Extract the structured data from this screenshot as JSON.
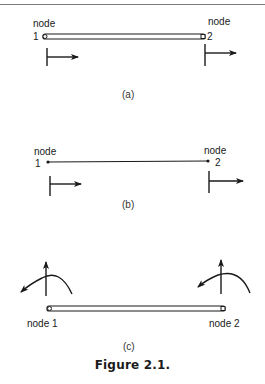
{
  "panels": [
    {
      "id": "a",
      "label": "(a)",
      "element": "bar",
      "nodes": [
        {
          "name_label": "node",
          "number_label": "1",
          "dof": "axial-displacement-arrow"
        },
        {
          "name_label": "node",
          "number_label": "2",
          "dof": "axial-displacement-arrow"
        }
      ]
    },
    {
      "id": "b",
      "label": "(b)",
      "element": "line",
      "nodes": [
        {
          "name_label": "node",
          "number_label": "1",
          "dof": "axial-displacement-arrow"
        },
        {
          "name_label": "node",
          "number_label": "2",
          "dof": "axial-displacement-arrow"
        }
      ]
    },
    {
      "id": "c",
      "label": "(c)",
      "element": "beam",
      "nodes": [
        {
          "label": "node 1",
          "dof": [
            "transverse-displacement-arrow",
            "rotation-arrow"
          ]
        },
        {
          "label": "node 2",
          "dof": [
            "transverse-displacement-arrow",
            "rotation-arrow"
          ]
        }
      ]
    }
  ],
  "caption": "Figure 2.1.",
  "colors": {
    "ink": "#1a1a1a",
    "rule": "#7a7a7a",
    "background": "#ffffff"
  }
}
